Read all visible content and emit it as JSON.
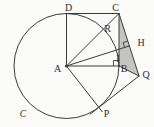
{
  "figure": {
    "labels": {
      "A": "A",
      "B": "B",
      "C": "C",
      "D": "D",
      "H": "H",
      "I": "I",
      "P": "P",
      "Q": "Q",
      "R": "R",
      "circle": "C"
    },
    "colors": {
      "line": "#3a3a38",
      "shade": "#c4c4c2",
      "text": "#2e2e2c",
      "background": "#fafaf8"
    }
  }
}
